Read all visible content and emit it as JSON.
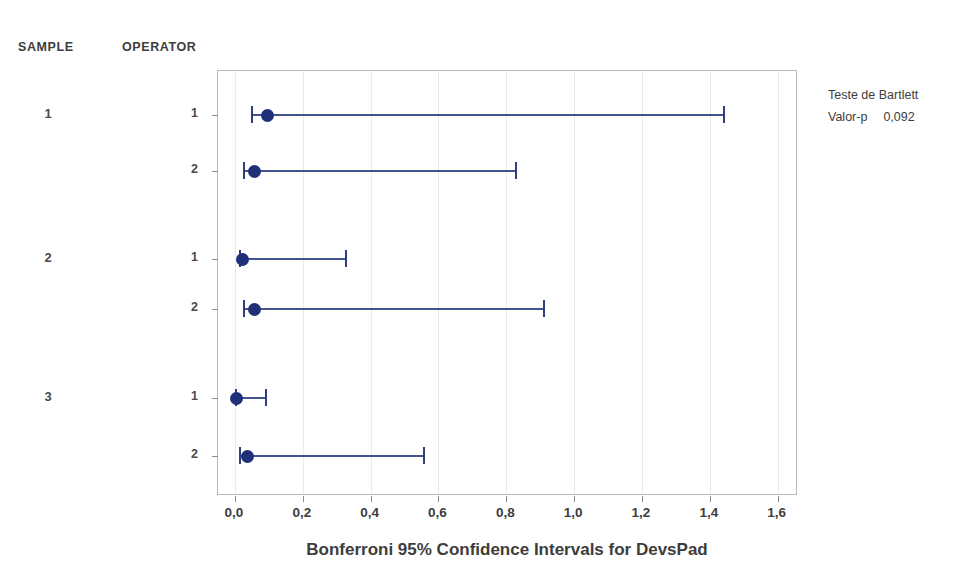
{
  "columns": {
    "sample_header": "SAMPLE",
    "operator_header": "OPERATOR"
  },
  "legend": {
    "title": "Teste de Bartlett",
    "pvalue_label": "Valor-p",
    "pvalue": "0,092"
  },
  "colors": {
    "marker": "#1f2f78",
    "line": "#42558f",
    "frame": "#b9b9b9",
    "grid": "#e9e9ef",
    "text": "#3d3d3d"
  },
  "chart_data": {
    "type": "scatter",
    "title": "Bonferroni 95% Confidence Intervals for DevsPad",
    "xlabel": "Bonferroni 95% Confidence Intervals for DevsPad",
    "ylabel": "",
    "xlim": [
      -0.05,
      1.66
    ],
    "xticks": [
      0.0,
      0.2,
      0.4,
      0.6,
      0.8,
      1.0,
      1.2,
      1.4,
      1.6
    ],
    "xtick_labels": [
      "0,0",
      "0,2",
      "0,4",
      "0,6",
      "0,8",
      "1,0",
      "1,2",
      "1,4",
      "1,6"
    ],
    "grid": true,
    "legend_position": "right",
    "groups": [
      {
        "sample": "1",
        "rows": [
          0,
          1
        ]
      },
      {
        "sample": "2",
        "rows": [
          2,
          3
        ]
      },
      {
        "sample": "3",
        "rows": [
          4,
          5
        ]
      }
    ],
    "rows": [
      {
        "sample": "1",
        "operator": "1",
        "center": 0.095,
        "lower": 0.046,
        "upper": 1.44
      },
      {
        "sample": "1",
        "operator": "2",
        "center": 0.057,
        "lower": 0.024,
        "upper": 0.825
      },
      {
        "sample": "2",
        "operator": "1",
        "center": 0.022,
        "lower": 0.011,
        "upper": 0.325
      },
      {
        "sample": "2",
        "operator": "2",
        "center": 0.059,
        "lower": 0.025,
        "upper": 0.908
      },
      {
        "sample": "3",
        "operator": "1",
        "center": 0.004,
        "lower": 0.0,
        "upper": 0.089
      },
      {
        "sample": "3",
        "operator": "2",
        "center": 0.037,
        "lower": 0.012,
        "upper": 0.555
      }
    ]
  }
}
